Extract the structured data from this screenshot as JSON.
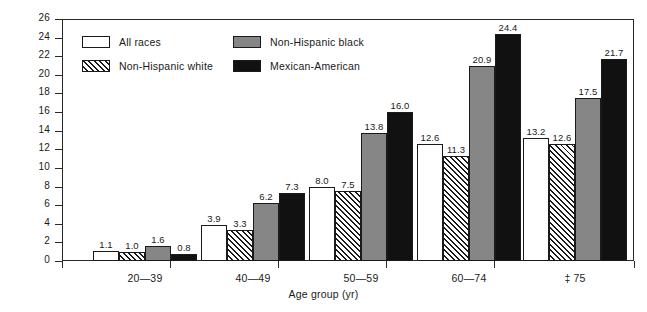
{
  "chart_data": {
    "type": "bar",
    "title": "",
    "xlabel": "Age group (yr)",
    "ylabel": "Percent",
    "ylim": [
      0,
      26
    ],
    "ytick_step": 2,
    "yticks": [
      0,
      2,
      4,
      6,
      8,
      10,
      12,
      14,
      16,
      18,
      20,
      22,
      24,
      26
    ],
    "ytick_labels": [
      "0",
      "2",
      "4",
      "6",
      "8",
      "10",
      "12",
      "14",
      "16",
      "18",
      "20",
      "22",
      "24",
      "26"
    ],
    "grid": false,
    "legend_position": "upper-left-inside",
    "categories": [
      "20—39",
      "40—49",
      "50—59",
      "60—74",
      "‡ 75"
    ],
    "series": [
      {
        "name": "All races",
        "color": "#ffffff",
        "fill": "solid-white",
        "values": [
          1.1,
          3.9,
          8.0,
          12.6,
          13.2
        ],
        "labels": [
          "1.1",
          "3.9",
          "8.0",
          "12.6",
          "13.2"
        ]
      },
      {
        "name": "Non-Hispanic white",
        "color": "#ffffff",
        "fill": "diagonal-hatch",
        "values": [
          1.0,
          3.3,
          7.5,
          11.3,
          12.6
        ],
        "labels": [
          "1.0",
          "3.3",
          "7.5",
          "11.3",
          "12.6"
        ]
      },
      {
        "name": "Non-Hispanic black",
        "color": "#868686",
        "fill": "solid-gray",
        "values": [
          1.6,
          6.2,
          13.8,
          20.9,
          17.5
        ],
        "labels": [
          "1.6",
          "6.2",
          "13.8",
          "20.9",
          "17.5"
        ]
      },
      {
        "name": "Mexican-American",
        "color": "#111111",
        "fill": "solid-black",
        "values": [
          0.8,
          7.3,
          16.0,
          24.4,
          21.7
        ],
        "labels": [
          "0.8",
          "7.3",
          "16.0",
          "24.4",
          "21.7"
        ]
      }
    ]
  },
  "legend": {
    "items": [
      {
        "label": "All races",
        "swatch": "allraces"
      },
      {
        "label": "Non-Hispanic white",
        "swatch": "nhwhite"
      },
      {
        "label": "Non-Hispanic black",
        "swatch": "nhblack"
      },
      {
        "label": "Mexican-American",
        "swatch": "mexam"
      }
    ]
  },
  "axes": {
    "y_title": "Percent",
    "x_title": "Age group (yr)"
  }
}
